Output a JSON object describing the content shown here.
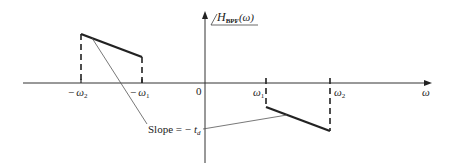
{
  "figure": {
    "function_label": {
      "main": "H",
      "subscript": "BPF",
      "argument": "(ω)"
    },
    "x_axis": {
      "label": "ω",
      "ticks": [
        {
          "id": "neg-omega2",
          "sign": "−",
          "symbol": "ω",
          "sub": "2"
        },
        {
          "id": "neg-omega1",
          "sign": "−",
          "symbol": "ω",
          "sub": "1"
        },
        {
          "id": "origin",
          "text": "0"
        },
        {
          "id": "omega1",
          "sign": "",
          "symbol": "ω",
          "sub": "1"
        },
        {
          "id": "omega2",
          "sign": "",
          "symbol": "ω",
          "sub": "2"
        }
      ]
    },
    "annotation": {
      "prefix": "Slope = −",
      "symbol": "t",
      "sub": "d"
    },
    "colors": {
      "line": "#222222",
      "axis": "#333333",
      "thin": "#555555"
    }
  }
}
